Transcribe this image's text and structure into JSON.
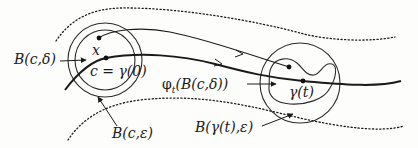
{
  "diagram": {
    "type": "flow-of-neighborhood-along-trajectory",
    "labels": {
      "ball_c_delta": "B(c,δ)",
      "point_x": "x",
      "point_c": "c = γ(0)",
      "ball_c_eps": "B(c,ε)",
      "flow_image": "φt(B(c,δ))",
      "flow_phi": "φ",
      "flow_sub": "t",
      "flow_arg": "(B(c,δ))",
      "gamma_t": "γ(t)",
      "ball_gamma_eps": "B(γ(t),ε)"
    },
    "nodes": [
      {
        "id": "x",
        "label": "x",
        "pos": [
          99,
          38
        ]
      },
      {
        "id": "c",
        "label": "c = γ(0)",
        "pos": [
          106,
          58
        ]
      },
      {
        "id": "gamma_t",
        "label": "γ(t)",
        "pos": [
          303,
          81
        ]
      },
      {
        "id": "phi_x",
        "label": "",
        "pos": [
          289,
          67
        ]
      }
    ],
    "shapes": [
      {
        "id": "ball_c_eps",
        "kind": "circle",
        "center": [
          105,
          60
        ],
        "r": 37
      },
      {
        "id": "ball_c_delta",
        "kind": "circle",
        "center": [
          105,
          60
        ],
        "r": 30
      },
      {
        "id": "ball_gamma_eps",
        "kind": "circle",
        "center": [
          300,
          83
        ],
        "r": 40
      },
      {
        "id": "flow_image",
        "kind": "blob"
      }
    ],
    "curves": [
      {
        "id": "trajectory_gamma",
        "style": "thick",
        "from": "left",
        "to": "right",
        "arrow": true
      },
      {
        "id": "trajectory_x",
        "style": "thin",
        "from": "x",
        "to": "phi_x",
        "arrow": true
      },
      {
        "id": "tube_upper",
        "style": "dotted"
      },
      {
        "id": "tube_lower",
        "style": "dotted"
      }
    ],
    "colors": {
      "ink": "#1a1a1a",
      "background": "#fdfdfc"
    }
  }
}
